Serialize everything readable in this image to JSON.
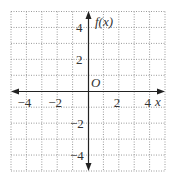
{
  "chart_data": {
    "type": "line",
    "title": "",
    "xlabel": "x",
    "ylabel": "f(x)",
    "origin_label": "O",
    "xlim": [
      -5,
      5
    ],
    "ylim": [
      -5,
      5
    ],
    "grid": true,
    "grid_style": "dotted",
    "x_ticks": [
      {
        "value": -4,
        "label": "−4"
      },
      {
        "value": -2,
        "label": "−2"
      },
      {
        "value": 2,
        "label": "2"
      },
      {
        "value": 4,
        "label": "4"
      }
    ],
    "y_ticks": [
      {
        "value": 4,
        "label": "4"
      },
      {
        "value": 2,
        "label": "2"
      },
      {
        "value": -2,
        "label": "−2"
      },
      {
        "value": -4,
        "label": "−4"
      }
    ],
    "series": [],
    "colors": {
      "grid": "#9a9a9a",
      "axis": "#222222",
      "text": "#333333"
    }
  }
}
